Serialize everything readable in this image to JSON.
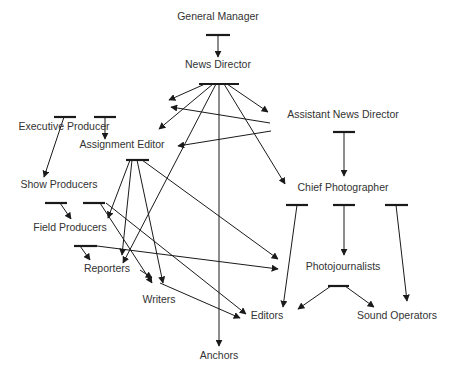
{
  "diagram": {
    "type": "org-chart",
    "colors": {
      "line": "#1a1a1a",
      "text": "#333333",
      "background": "#ffffff"
    },
    "nodes": [
      {
        "id": "gm",
        "label": "General Manager",
        "x": 218,
        "y": 16
      },
      {
        "id": "nd",
        "label": "News Director",
        "x": 218,
        "y": 64
      },
      {
        "id": "ep",
        "label": "Executive Producer",
        "x": 64,
        "y": 126
      },
      {
        "id": "and",
        "label": "Assistant News Director",
        "x": 343,
        "y": 114
      },
      {
        "id": "ae",
        "label": "Assignment Editor",
        "x": 122,
        "y": 144
      },
      {
        "id": "sp",
        "label": "Show Producers",
        "x": 59,
        "y": 184
      },
      {
        "id": "cp",
        "label": "Chief Photographer",
        "x": 343,
        "y": 187
      },
      {
        "id": "fp",
        "label": "Field Producers",
        "x": 70,
        "y": 227
      },
      {
        "id": "pj",
        "label": "Photojournalists",
        "x": 343,
        "y": 266
      },
      {
        "id": "rep",
        "label": "Reporters",
        "x": 107,
        "y": 268
      },
      {
        "id": "wri",
        "label": "Writers",
        "x": 159,
        "y": 299
      },
      {
        "id": "edi",
        "label": "Editors",
        "x": 267,
        "y": 315
      },
      {
        "id": "so",
        "label": "Sound Operators",
        "x": 397,
        "y": 315
      },
      {
        "id": "anc",
        "label": "Anchors",
        "x": 219,
        "y": 355
      }
    ],
    "bars": [
      {
        "from": "gm",
        "x1": 206,
        "x2": 230,
        "y": 35
      },
      {
        "from": "nd",
        "x1": 199,
        "x2": 239,
        "y": 84
      },
      {
        "from": "ep",
        "x1": 54,
        "x2": 76,
        "y": 117
      },
      {
        "from": "ep",
        "x1": 94,
        "x2": 116,
        "y": 117
      },
      {
        "from": "ae",
        "x1": 126,
        "x2": 149,
        "y": 160
      },
      {
        "from": "and",
        "x1": 333,
        "x2": 355,
        "y": 132
      },
      {
        "from": "sp",
        "x1": 45,
        "x2": 67,
        "y": 203
      },
      {
        "from": "sp",
        "x1": 83,
        "x2": 105,
        "y": 203
      },
      {
        "from": "cp",
        "x1": 286,
        "x2": 308,
        "y": 205
      },
      {
        "from": "cp",
        "x1": 333,
        "x2": 355,
        "y": 205
      },
      {
        "from": "cp",
        "x1": 385,
        "x2": 408,
        "y": 205
      },
      {
        "from": "fp",
        "x1": 74,
        "x2": 97,
        "y": 246
      },
      {
        "from": "pj",
        "x1": 328,
        "x2": 349,
        "y": 286
      }
    ],
    "edges": [
      {
        "from": "gm",
        "to": "nd",
        "x1": 218,
        "y1": 35,
        "x2": 218,
        "y2": 57
      },
      {
        "from": "nd",
        "to": "ep-area",
        "x1": 205,
        "y1": 84,
        "x2": 169,
        "y2": 100
      },
      {
        "from": "nd",
        "to": "ae",
        "x1": 213,
        "y1": 84,
        "x2": 159,
        "y2": 129
      },
      {
        "from": "nd",
        "to": "reporters",
        "x1": 216,
        "y1": 84,
        "x2": 123,
        "y2": 263
      },
      {
        "from": "nd",
        "to": "anchors",
        "x1": 219,
        "y1": 84,
        "x2": 219,
        "y2": 346
      },
      {
        "from": "nd",
        "to": "chief-photographer",
        "x1": 224,
        "y1": 84,
        "x2": 285,
        "y2": 184
      },
      {
        "from": "nd",
        "to": "and",
        "x1": 227,
        "y1": 84,
        "x2": 268,
        "y2": 112
      },
      {
        "from": "and",
        "to": "nd-area",
        "x1": 270,
        "y1": 123,
        "x2": 171,
        "y2": 107
      },
      {
        "from": "and",
        "to": "ae",
        "x1": 271,
        "y1": 131,
        "x2": 178,
        "y2": 146
      },
      {
        "from": "and",
        "to": "cp",
        "x1": 344,
        "y1": 132,
        "x2": 344,
        "y2": 176
      },
      {
        "from": "ep",
        "to": "sp",
        "x1": 64,
        "y1": 117,
        "x2": 44,
        "y2": 177
      },
      {
        "from": "ep",
        "to": "ae",
        "x1": 105,
        "y1": 117,
        "x2": 105,
        "y2": 139
      },
      {
        "from": "ae",
        "to": "field-producers",
        "x1": 130,
        "y1": 160,
        "x2": 108,
        "y2": 218
      },
      {
        "from": "ae",
        "to": "reporters",
        "x1": 132,
        "y1": 160,
        "x2": 122,
        "y2": 255
      },
      {
        "from": "ae",
        "to": "writers",
        "x1": 137,
        "y1": 160,
        "x2": 163,
        "y2": 283
      },
      {
        "from": "ae",
        "to": "editors",
        "x1": 142,
        "y1": 160,
        "x2": 278,
        "y2": 259
      },
      {
        "from": "sp",
        "to": "fp",
        "x1": 60,
        "y1": 203,
        "x2": 71,
        "y2": 219
      },
      {
        "from": "sp",
        "to": "writers",
        "x1": 100,
        "y1": 203,
        "x2": 152,
        "y2": 283
      },
      {
        "from": "sp",
        "to": "editors",
        "x1": 106,
        "y1": 203,
        "x2": 246,
        "y2": 314
      },
      {
        "from": "fp",
        "to": "rep",
        "x1": 80,
        "y1": 246,
        "x2": 90,
        "y2": 260
      },
      {
        "from": "fp",
        "to": "photojournalists-area",
        "x1": 97,
        "y1": 246,
        "x2": 278,
        "y2": 269
      },
      {
        "from": "rep",
        "to": "wri",
        "x1": 140,
        "y1": 270,
        "x2": 152,
        "y2": 278
      },
      {
        "from": "wri",
        "to": "edi",
        "x1": 160,
        "y1": 283,
        "x2": 240,
        "y2": 318
      },
      {
        "from": "cp",
        "to": "edi",
        "x1": 297,
        "y1": 205,
        "x2": 283,
        "y2": 307
      },
      {
        "from": "cp",
        "to": "pj",
        "x1": 344,
        "y1": 205,
        "x2": 344,
        "y2": 255
      },
      {
        "from": "cp",
        "to": "so",
        "x1": 396,
        "y1": 205,
        "x2": 407,
        "y2": 301
      },
      {
        "from": "pj",
        "to": "edi",
        "x1": 331,
        "y1": 286,
        "x2": 298,
        "y2": 309
      },
      {
        "from": "pj",
        "to": "so",
        "x1": 345,
        "y1": 286,
        "x2": 374,
        "y2": 307
      }
    ]
  }
}
